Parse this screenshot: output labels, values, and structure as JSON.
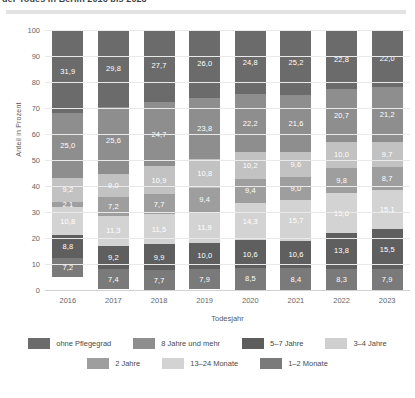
{
  "title": "der Todes in Berlin 2016 bis 2023",
  "chart_data": {
    "type": "bar",
    "stacked": true,
    "title": "",
    "xlabel": "Todesjahr",
    "ylabel": "Anteil in Prozent",
    "ylim": [
      0,
      100
    ],
    "yticks": [
      0,
      10,
      20,
      30,
      40,
      50,
      60,
      70,
      80,
      90,
      100
    ],
    "grid": true,
    "legend_position": "bottom",
    "categories": [
      "2016",
      "2017",
      "2018",
      "2019",
      "2020",
      "2021",
      "2022",
      "2023"
    ],
    "series": [
      {
        "name": "1–2 Monate",
        "color": "#7a7a7a",
        "values": [
          7.2,
          7.4,
          7.7,
          7.9,
          8.5,
          8.4,
          8.3,
          7.9
        ]
      },
      {
        "name": "13–24 Monate",
        "color": "#5f5f5f",
        "values": [
          8.8,
          9.2,
          9.9,
          10.0,
          10.6,
          10.6,
          13.8,
          15.5
        ]
      },
      {
        "name": "2 Jahre",
        "color": "#d3d3d3",
        "values": [
          10.8,
          11.3,
          11.5,
          11.9,
          14.3,
          15.7,
          15.6,
          15.1
        ]
      },
      {
        "name": "3–4 Jahre",
        "color": "#9e9e9e",
        "values": [
          2.1,
          7.2,
          7.7,
          9.4,
          9.4,
          9.0,
          9.8,
          8.7
        ]
      },
      {
        "name": "5–7 Jahre",
        "color": "#c2c2c2",
        "values": [
          9.2,
          9.0,
          10.9,
          10.8,
          10.2,
          9.6,
          10.0,
          9.7
        ]
      },
      {
        "name": "8 Jahre und mehr",
        "color": "#8e8e8e",
        "values": [
          25.0,
          25.6,
          24.7,
          23.8,
          22.2,
          21.6,
          20.7,
          21.2
        ]
      },
      {
        "name": "ohne Pflegegrad",
        "color": "#6b6b6b",
        "values": [
          31.9,
          29.8,
          27.7,
          26.0,
          24.8,
          25.2,
          22.8,
          22.0
        ]
      }
    ],
    "value_labels": {
      "2016": {
        "ohne Pflegegrad": "31,9",
        "8 Jahre und mehr": "25,0",
        "5–7 Jahre": "9,2",
        "3–4 Jahre": "2,1",
        "2 Jahre": "10,8",
        "13–24 Monate": "8,8",
        "1–2 Monate": "7,2"
      },
      "2017": {
        "ohne Pflegegrad": "29,8",
        "8 Jahre und mehr": "25,6",
        "5–7 Jahre": "9,0",
        "3–4 Jahre": "7,2",
        "2 Jahre": "11,3",
        "13–24 Monate": "9,2",
        "1–2 Monate": "7,4"
      },
      "2018": {
        "ohne Pflegegrad": "27,7",
        "8 Jahre und mehr": "24,7",
        "5–7 Jahre": "10,9",
        "3–4 Jahre": "7,7",
        "2 Jahre": "11,5",
        "13–24 Monate": "9,9",
        "1–2 Monate": "7,7"
      },
      "2019": {
        "ohne Pflegegrad": "26,0",
        "8 Jahre und mehr": "23,8",
        "5–7 Jahre": "10,8",
        "3–4 Jahre": "9,4",
        "2 Jahre": "11,9",
        "13–24 Monate": "10,0",
        "1–2 Monate": "7,9"
      },
      "2020": {
        "ohne Pflegegrad": "24,8",
        "8 Jahre und mehr": "22,2",
        "5–7 Jahre": "10,2",
        "3–4 Jahre": "9,4",
        "2 Jahre": "14,3",
        "13–24 Monate": "10,6",
        "1–2 Monate": "8,5"
      },
      "2021": {
        "ohne Pflegegrad": "25,2",
        "8 Jahre und mehr": "21,6",
        "5–7 Jahre": "9,6",
        "3–4 Jahre": "9,0",
        "2 Jahre": "15,7",
        "13–24 Monate": "10,6",
        "1–2 Monate": "8,4"
      },
      "2022": {
        "ohne Pflegegrad": "22,8",
        "8 Jahre und mehr": "20,7",
        "5–7 Jahre": "10,0",
        "3–4 Jahre": "9,8",
        "2 Jahre": "15,6",
        "13–24 Monate": "13,8",
        "1–2 Monate": "8,3"
      },
      "2023": {
        "ohne Pflegegrad": "22,0",
        "8 Jahre und mehr": "21,2",
        "5–7 Jahre": "9,7",
        "3–4 Jahre": "8,7",
        "2 Jahre": "15,1",
        "13–24 Monate": "15,5",
        "1–2 Monate": "7,9"
      }
    }
  },
  "legend": {
    "rows": [
      [
        {
          "label": "ohne Pflegegrad",
          "color": "#6b6b6b"
        },
        {
          "label": "8 Jahre und mehr",
          "color": "#8e8e8e"
        },
        {
          "label": "5–7 Jahre",
          "color": "#5d5d5d"
        },
        {
          "label": "3–4 Jahre",
          "color": "#cfcfcf"
        }
      ],
      [
        {
          "label": "2 Jahre",
          "color": "#9e9e9e"
        },
        {
          "label": "13–24 Monate",
          "color": "#d3d3d3"
        },
        {
          "label": "1–2 Monate",
          "color": "#7a7a7a"
        }
      ]
    ]
  }
}
